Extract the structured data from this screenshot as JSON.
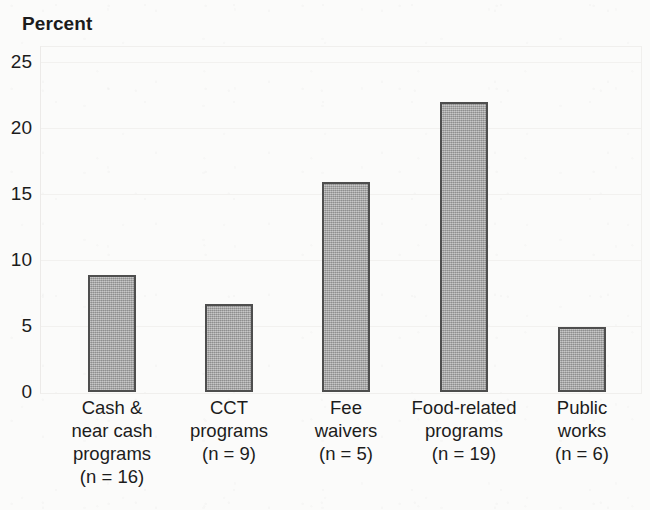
{
  "chart_data": {
    "type": "bar",
    "title": "Percent",
    "xlabel": "",
    "ylabel": "Percent",
    "ylim": [
      0,
      25
    ],
    "yticks": [
      0,
      5,
      10,
      15,
      20,
      25
    ],
    "ytick_labels": [
      "0",
      "5",
      "10",
      "15",
      "20",
      "25"
    ],
    "grid": "faint horizontal gridlines at y ticks",
    "legend": "none",
    "categories": [
      "Cash & near cash programs (n = 16)",
      "CCT programs (n = 9)",
      "Fee waivers (n = 5)",
      "Food-related programs (n = 19)",
      "Public works (n = 6)"
    ],
    "values": [
      8.9,
      6.7,
      15.9,
      22.0,
      4.9
    ],
    "bar_color": "#ababab",
    "bar_edge_color": "#4e4e4e",
    "background_color": "#fbfbfa",
    "text_color": "#1c1c1c",
    "bars": [
      {
        "value": 8.9,
        "n_label": "(n = 16)",
        "label_lines": [
          "Cash &",
          "near cash",
          "programs",
          "(n = 16)"
        ]
      },
      {
        "value": 6.7,
        "n_label": "(n = 9)",
        "label_lines": [
          "CCT",
          "programs",
          "(n = 9)"
        ]
      },
      {
        "value": 15.9,
        "n_label": "(n = 5)",
        "label_lines": [
          "Fee",
          "waivers",
          "(n = 5)"
        ]
      },
      {
        "value": 22.0,
        "n_label": "(n = 19)",
        "label_lines": [
          "Food-related",
          "programs",
          "(n = 19)"
        ]
      },
      {
        "value": 4.9,
        "n_label": "(n = 6)",
        "label_lines": [
          "Public",
          "works",
          "(n = 6)"
        ]
      }
    ]
  }
}
